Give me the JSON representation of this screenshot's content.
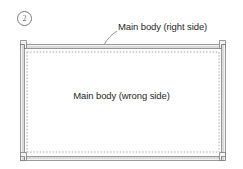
{
  "figure": {
    "step_number": "2",
    "callout_label": "Main body (right side)",
    "center_label": "Main body (wrong side)",
    "colors": {
      "background": "#ffffff",
      "ink": "#1f1f1f",
      "band_outline": "#6f6f6f",
      "band_fill_light": "#fbfbfb",
      "band_fill_mid": "#d2d2d2",
      "dotted_line": "#9a9a9a",
      "leader_line": "#8c8c8c",
      "badge_outline": "#7a7a7a"
    },
    "geometry": {
      "frame_left": 20,
      "frame_top": 44,
      "frame_right": 226,
      "frame_bottom": 161,
      "band_thickness": 4,
      "dotted_inset": 6,
      "corner_notch_size": 5
    }
  }
}
